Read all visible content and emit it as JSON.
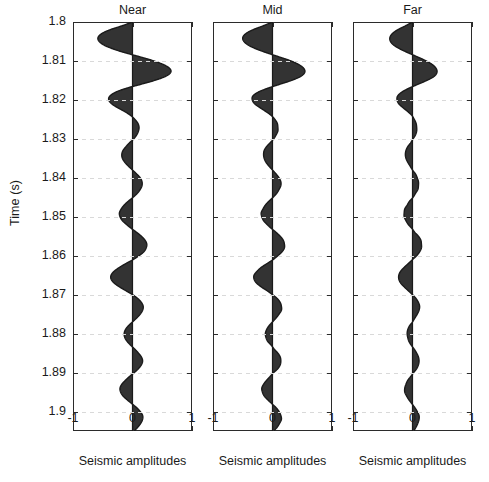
{
  "figure": {
    "ylabel": "Time (s)",
    "panels": [
      {
        "name": "near",
        "title": "Near",
        "xlabel": "Seismic amplitudes"
      },
      {
        "name": "mid",
        "title": "Mid",
        "xlabel": "Seismic amplitudes"
      },
      {
        "name": "far",
        "title": "Far",
        "xlabel": "Seismic amplitudes"
      }
    ],
    "xticks": [
      "-1",
      "0",
      "1"
    ],
    "yticks": [
      "1.8",
      "1.81",
      "1.82",
      "1.83",
      "1.84",
      "1.85",
      "1.86",
      "1.87",
      "1.88",
      "1.89",
      "1.9"
    ],
    "colors": {
      "fill": "#333333",
      "line": "#1a1a1a",
      "frame": "#2b2b2b",
      "grid": "#d9d9d9",
      "background": "#ffffff",
      "text": "#1a1a1a"
    }
  },
  "chart_data": {
    "type": "line",
    "title": "",
    "subtitle": "",
    "xlabel": "Seismic amplitudes",
    "ylabel": "Time (s)",
    "xlim": [
      -1,
      1
    ],
    "ylim": [
      1.8,
      1.905
    ],
    "y_inverted": true,
    "grid": true,
    "legend": null,
    "xticks": [
      -1,
      0,
      1
    ],
    "yticks": [
      1.8,
      1.81,
      1.82,
      1.83,
      1.84,
      1.85,
      1.86,
      1.87,
      1.88,
      1.89,
      1.9
    ],
    "style": "wiggle-variable-area",
    "t": [
      1.8,
      1.801,
      1.802,
      1.803,
      1.804,
      1.805,
      1.806,
      1.807,
      1.808,
      1.809,
      1.81,
      1.811,
      1.812,
      1.813,
      1.814,
      1.815,
      1.816,
      1.817,
      1.818,
      1.819,
      1.82,
      1.821,
      1.822,
      1.823,
      1.824,
      1.825,
      1.826,
      1.827,
      1.828,
      1.829,
      1.83,
      1.831,
      1.832,
      1.833,
      1.834,
      1.835,
      1.836,
      1.837,
      1.838,
      1.839,
      1.84,
      1.841,
      1.842,
      1.843,
      1.844,
      1.845,
      1.846,
      1.847,
      1.848,
      1.849,
      1.85,
      1.851,
      1.852,
      1.853,
      1.854,
      1.855,
      1.856,
      1.857,
      1.858,
      1.859,
      1.86,
      1.861,
      1.862,
      1.863,
      1.864,
      1.865,
      1.866,
      1.867,
      1.868,
      1.869,
      1.87,
      1.871,
      1.872,
      1.873,
      1.874,
      1.875,
      1.876,
      1.877,
      1.878,
      1.879,
      1.88,
      1.881,
      1.882,
      1.883,
      1.884,
      1.885,
      1.886,
      1.887,
      1.888,
      1.889,
      1.89,
      1.891,
      1.892,
      1.893,
      1.894,
      1.895,
      1.896,
      1.897,
      1.898,
      1.899,
      1.9,
      1.901,
      1.902,
      1.903,
      1.904,
      1.905
    ],
    "series": [
      {
        "name": "Near",
        "panel": "near",
        "values": [
          0.0,
          -0.18,
          -0.38,
          -0.52,
          -0.58,
          -0.56,
          -0.47,
          -0.31,
          -0.1,
          0.14,
          0.36,
          0.53,
          0.63,
          0.64,
          0.55,
          0.37,
          0.14,
          -0.1,
          -0.28,
          -0.38,
          -0.4,
          -0.35,
          -0.25,
          -0.13,
          -0.03,
          0.04,
          0.09,
          0.11,
          0.1,
          0.07,
          0.02,
          -0.05,
          -0.11,
          -0.16,
          -0.18,
          -0.17,
          -0.13,
          -0.07,
          0.0,
          0.07,
          0.13,
          0.16,
          0.16,
          0.13,
          0.08,
          0.01,
          -0.07,
          -0.14,
          -0.19,
          -0.22,
          -0.21,
          -0.17,
          -0.1,
          -0.02,
          0.07,
          0.15,
          0.21,
          0.24,
          0.23,
          0.19,
          0.11,
          0.01,
          -0.11,
          -0.22,
          -0.31,
          -0.36,
          -0.36,
          -0.31,
          -0.22,
          -0.11,
          0.0,
          0.09,
          0.15,
          0.18,
          0.17,
          0.13,
          0.07,
          0.0,
          -0.07,
          -0.12,
          -0.14,
          -0.13,
          -0.09,
          -0.03,
          0.04,
          0.1,
          0.15,
          0.17,
          0.15,
          0.1,
          0.03,
          -0.05,
          -0.12,
          -0.18,
          -0.21,
          -0.2,
          -0.16,
          -0.09,
          -0.01,
          0.07,
          0.13,
          0.17,
          0.17,
          0.14,
          0.09,
          0.03
        ]
      },
      {
        "name": "Mid",
        "panel": "mid",
        "values": [
          0.0,
          -0.16,
          -0.33,
          -0.45,
          -0.5,
          -0.48,
          -0.4,
          -0.26,
          -0.08,
          0.12,
          0.31,
          0.45,
          0.53,
          0.54,
          0.47,
          0.32,
          0.12,
          -0.08,
          -0.24,
          -0.33,
          -0.34,
          -0.3,
          -0.21,
          -0.11,
          -0.02,
          0.04,
          0.08,
          0.09,
          0.09,
          0.06,
          0.02,
          -0.04,
          -0.1,
          -0.14,
          -0.15,
          -0.14,
          -0.11,
          -0.06,
          0.0,
          0.06,
          0.11,
          0.14,
          0.14,
          0.11,
          0.07,
          0.01,
          -0.06,
          -0.12,
          -0.16,
          -0.19,
          -0.18,
          -0.15,
          -0.09,
          -0.02,
          0.06,
          0.13,
          0.18,
          0.2,
          0.2,
          0.16,
          0.09,
          0.01,
          -0.09,
          -0.19,
          -0.26,
          -0.31,
          -0.31,
          -0.27,
          -0.19,
          -0.09,
          0.0,
          0.08,
          0.13,
          0.15,
          0.15,
          0.11,
          0.06,
          0.0,
          -0.06,
          -0.1,
          -0.12,
          -0.11,
          -0.08,
          -0.02,
          0.03,
          0.09,
          0.13,
          0.14,
          0.13,
          0.09,
          0.02,
          -0.04,
          -0.1,
          -0.15,
          -0.18,
          -0.17,
          -0.14,
          -0.08,
          -0.01,
          0.06,
          0.11,
          0.14,
          0.15,
          0.12,
          0.08,
          0.02
        ]
      },
      {
        "name": "Far",
        "panel": "far",
        "values": [
          0.0,
          -0.12,
          -0.25,
          -0.34,
          -0.38,
          -0.37,
          -0.31,
          -0.2,
          -0.06,
          0.09,
          0.23,
          0.34,
          0.4,
          0.41,
          0.36,
          0.24,
          0.09,
          -0.06,
          -0.18,
          -0.25,
          -0.26,
          -0.23,
          -0.16,
          -0.08,
          -0.01,
          0.03,
          0.06,
          0.07,
          0.07,
          0.05,
          0.01,
          -0.03,
          -0.08,
          -0.11,
          -0.12,
          -0.11,
          -0.08,
          -0.04,
          0.0,
          0.05,
          0.08,
          0.1,
          0.1,
          0.09,
          0.05,
          0.01,
          -0.05,
          -0.09,
          -0.13,
          -0.14,
          -0.14,
          -0.11,
          -0.07,
          -0.01,
          0.04,
          0.1,
          0.14,
          0.15,
          0.15,
          0.12,
          0.07,
          0.0,
          -0.07,
          -0.14,
          -0.2,
          -0.23,
          -0.23,
          -0.2,
          -0.14,
          -0.07,
          0.0,
          0.06,
          0.1,
          0.12,
          0.11,
          0.08,
          0.04,
          0.0,
          -0.05,
          -0.08,
          -0.09,
          -0.08,
          -0.06,
          -0.02,
          0.03,
          0.07,
          0.1,
          0.11,
          0.1,
          0.07,
          0.02,
          -0.03,
          -0.08,
          -0.11,
          -0.13,
          -0.13,
          -0.1,
          -0.06,
          -0.01,
          0.04,
          0.08,
          0.11,
          0.11,
          0.09,
          0.06,
          0.02
        ]
      }
    ]
  }
}
